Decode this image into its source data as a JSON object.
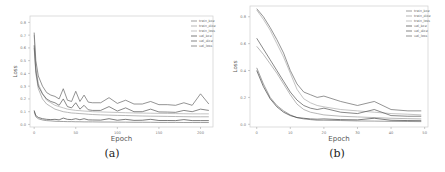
{
  "chart_data": [
    {
      "type": "line",
      "panel": "a",
      "caption": "(a)",
      "xlabel": "Epoch",
      "ylabel": "Loss",
      "xlim": [
        -5,
        215
      ],
      "ylim": [
        -0.02,
        0.85
      ],
      "xticks": [
        0,
        50,
        100,
        150,
        200
      ],
      "yticks": [
        0.0,
        0.1,
        0.2,
        0.3,
        0.4,
        0.5,
        0.6,
        0.7,
        0.8
      ],
      "grid": false,
      "legend_position": "upper right",
      "series": [
        {
          "name": "train_bce",
          "color": "#777777",
          "x": [
            0,
            2,
            5,
            10,
            15,
            20,
            25,
            30,
            35,
            40,
            45,
            50,
            55,
            60,
            65,
            70,
            80,
            90,
            100,
            110,
            120,
            130,
            140,
            150,
            160,
            170,
            180,
            190,
            200,
            210
          ],
          "values": [
            0.1,
            0.06,
            0.045,
            0.035,
            0.03,
            0.028,
            0.025,
            0.024,
            0.023,
            0.022,
            0.022,
            0.021,
            0.021,
            0.02,
            0.02,
            0.02,
            0.019,
            0.019,
            0.018,
            0.018,
            0.017,
            0.017,
            0.017,
            0.016,
            0.016,
            0.016,
            0.015,
            0.015,
            0.015,
            0.015
          ]
        },
        {
          "name": "train_dice",
          "color": "#999999",
          "x": [
            0,
            2,
            5,
            10,
            15,
            20,
            25,
            30,
            35,
            40,
            45,
            50,
            55,
            60,
            65,
            70,
            80,
            90,
            100,
            110,
            120,
            130,
            140,
            150,
            160,
            170,
            180,
            190,
            200,
            210
          ],
          "values": [
            0.6,
            0.4,
            0.28,
            0.2,
            0.16,
            0.14,
            0.12,
            0.11,
            0.1,
            0.095,
            0.09,
            0.088,
            0.085,
            0.083,
            0.08,
            0.078,
            0.075,
            0.073,
            0.071,
            0.07,
            0.068,
            0.066,
            0.065,
            0.064,
            0.063,
            0.062,
            0.061,
            0.06,
            0.06,
            0.06
          ]
        },
        {
          "name": "train_loss",
          "color": "#aaaaaa",
          "x": [
            0,
            2,
            5,
            10,
            15,
            20,
            25,
            30,
            35,
            40,
            45,
            50,
            55,
            60,
            65,
            70,
            80,
            90,
            100,
            110,
            120,
            130,
            140,
            150,
            160,
            170,
            180,
            190,
            200,
            210
          ],
          "values": [
            0.7,
            0.45,
            0.32,
            0.24,
            0.19,
            0.17,
            0.15,
            0.14,
            0.13,
            0.12,
            0.115,
            0.11,
            0.108,
            0.105,
            0.103,
            0.1,
            0.098,
            0.096,
            0.094,
            0.092,
            0.09,
            0.089,
            0.088,
            0.087,
            0.086,
            0.085,
            0.084,
            0.083,
            0.083,
            0.083
          ]
        },
        {
          "name": "val_bce",
          "color": "#444444",
          "x": [
            0,
            2,
            5,
            10,
            15,
            20,
            25,
            30,
            35,
            40,
            45,
            50,
            55,
            60,
            65,
            70,
            80,
            90,
            100,
            110,
            120,
            130,
            140,
            150,
            160,
            170,
            180,
            190,
            200,
            210
          ],
          "values": [
            0.11,
            0.07,
            0.055,
            0.045,
            0.04,
            0.038,
            0.04,
            0.036,
            0.05,
            0.04,
            0.038,
            0.045,
            0.037,
            0.045,
            0.036,
            0.035,
            0.034,
            0.045,
            0.033,
            0.04,
            0.032,
            0.033,
            0.04,
            0.031,
            0.031,
            0.03,
            0.038,
            0.03,
            0.03,
            0.03
          ]
        },
        {
          "name": "val_dice",
          "color": "#555555",
          "x": [
            0,
            2,
            5,
            10,
            15,
            20,
            25,
            30,
            35,
            40,
            45,
            50,
            55,
            60,
            65,
            70,
            80,
            90,
            100,
            110,
            120,
            130,
            140,
            150,
            160,
            170,
            180,
            190,
            200,
            210
          ],
          "values": [
            0.62,
            0.42,
            0.3,
            0.24,
            0.2,
            0.18,
            0.17,
            0.15,
            0.2,
            0.14,
            0.13,
            0.17,
            0.12,
            0.15,
            0.115,
            0.11,
            0.11,
            0.14,
            0.105,
            0.13,
            0.1,
            0.1,
            0.12,
            0.098,
            0.097,
            0.095,
            0.11,
            0.1,
            0.12,
            0.11
          ]
        },
        {
          "name": "val_loss",
          "color": "#666666",
          "x": [
            0,
            2,
            5,
            10,
            15,
            20,
            25,
            30,
            35,
            40,
            45,
            50,
            55,
            60,
            65,
            70,
            80,
            90,
            100,
            110,
            120,
            130,
            140,
            150,
            160,
            170,
            180,
            190,
            200,
            210
          ],
          "values": [
            0.72,
            0.5,
            0.38,
            0.3,
            0.25,
            0.23,
            0.22,
            0.2,
            0.28,
            0.19,
            0.18,
            0.26,
            0.18,
            0.23,
            0.175,
            0.17,
            0.17,
            0.21,
            0.165,
            0.19,
            0.16,
            0.16,
            0.18,
            0.155,
            0.155,
            0.15,
            0.17,
            0.15,
            0.24,
            0.16
          ]
        }
      ]
    },
    {
      "type": "line",
      "panel": "b",
      "caption": "(b)",
      "xlabel": "Epoch",
      "ylabel": "Loss",
      "xlim": [
        -2,
        51
      ],
      "ylim": [
        -0.02,
        0.88
      ],
      "xticks": [
        0,
        10,
        20,
        30,
        40,
        50
      ],
      "yticks": [
        0.0,
        0.2,
        0.4,
        0.6,
        0.8
      ],
      "grid": false,
      "legend_position": "upper right",
      "series": [
        {
          "name": "train_bce",
          "color": "#777777",
          "x": [
            0,
            2,
            4,
            6,
            8,
            10,
            12,
            14,
            16,
            18,
            20,
            25,
            30,
            35,
            40,
            45,
            49
          ],
          "values": [
            0.42,
            0.3,
            0.2,
            0.14,
            0.1,
            0.07,
            0.05,
            0.04,
            0.035,
            0.03,
            0.03,
            0.028,
            0.025,
            0.024,
            0.022,
            0.021,
            0.02
          ]
        },
        {
          "name": "train_dice",
          "color": "#999999",
          "x": [
            0,
            2,
            4,
            6,
            8,
            10,
            12,
            14,
            16,
            18,
            20,
            25,
            30,
            35,
            40,
            45,
            49
          ],
          "values": [
            0.58,
            0.52,
            0.45,
            0.38,
            0.3,
            0.22,
            0.15,
            0.11,
            0.09,
            0.08,
            0.07,
            0.06,
            0.055,
            0.05,
            0.045,
            0.042,
            0.04
          ]
        },
        {
          "name": "train_loss",
          "color": "#aaaaaa",
          "x": [
            0,
            2,
            4,
            6,
            8,
            10,
            12,
            14,
            16,
            18,
            20,
            25,
            30,
            35,
            40,
            45,
            49
          ],
          "values": [
            0.85,
            0.78,
            0.7,
            0.6,
            0.5,
            0.38,
            0.26,
            0.19,
            0.16,
            0.14,
            0.13,
            0.11,
            0.1,
            0.09,
            0.08,
            0.075,
            0.07
          ]
        },
        {
          "name": "val_bce",
          "color": "#444444",
          "x": [
            0,
            2,
            4,
            6,
            8,
            10,
            12,
            14,
            16,
            18,
            20,
            25,
            30,
            35,
            40,
            45,
            49
          ],
          "values": [
            0.4,
            0.28,
            0.19,
            0.13,
            0.09,
            0.065,
            0.05,
            0.045,
            0.04,
            0.038,
            0.04,
            0.035,
            0.033,
            0.045,
            0.03,
            0.028,
            0.027
          ]
        },
        {
          "name": "val_dice",
          "color": "#555555",
          "x": [
            0,
            2,
            4,
            6,
            8,
            10,
            12,
            14,
            16,
            18,
            20,
            25,
            30,
            35,
            40,
            45,
            49
          ],
          "values": [
            0.64,
            0.56,
            0.48,
            0.4,
            0.32,
            0.24,
            0.18,
            0.14,
            0.12,
            0.11,
            0.12,
            0.09,
            0.08,
            0.11,
            0.065,
            0.06,
            0.06
          ]
        },
        {
          "name": "val_loss",
          "color": "#666666",
          "x": [
            0,
            2,
            4,
            6,
            8,
            10,
            12,
            14,
            16,
            18,
            20,
            25,
            30,
            35,
            40,
            45,
            49
          ],
          "values": [
            0.86,
            0.8,
            0.72,
            0.63,
            0.53,
            0.4,
            0.3,
            0.24,
            0.22,
            0.2,
            0.21,
            0.17,
            0.14,
            0.17,
            0.11,
            0.1,
            0.1
          ]
        }
      ]
    }
  ]
}
